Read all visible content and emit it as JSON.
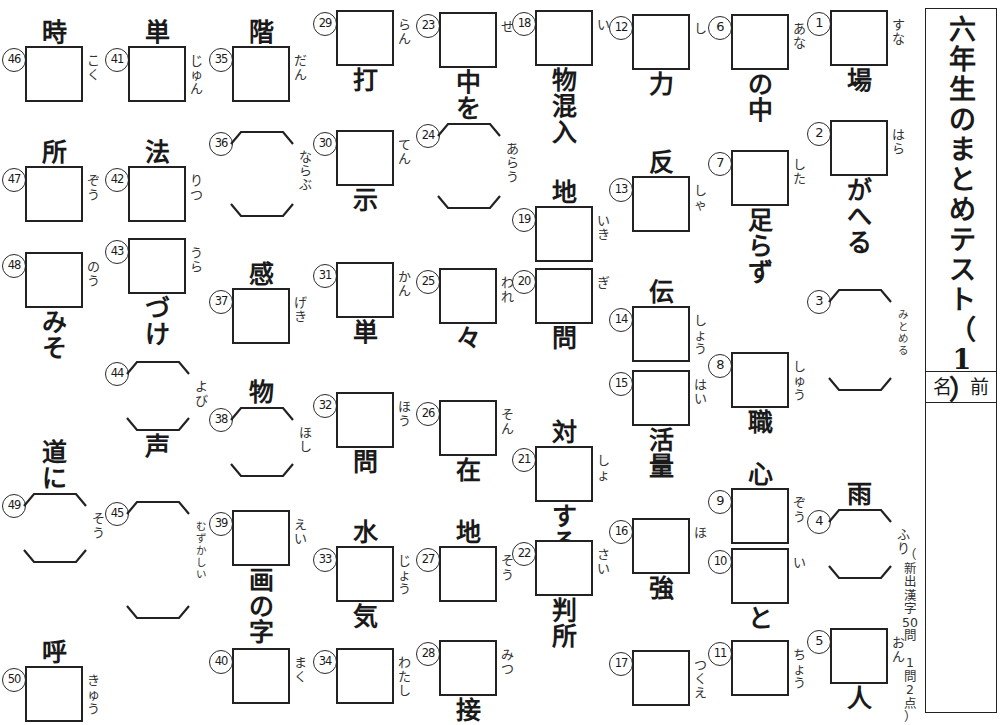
{
  "title_panel": {
    "title_chars": [
      "六",
      "年",
      "生",
      "の",
      "ま",
      "と",
      "め",
      "テ",
      "ス",
      "ト",
      "（",
      "1",
      "）"
    ],
    "name_label": "名 前",
    "score_note_chars": [
      "（",
      "新",
      "出",
      "漢",
      "字",
      "50",
      "問",
      "　",
      "1",
      "問",
      "2",
      "点",
      "）"
    ]
  },
  "columns": [
    {
      "col_index": 0,
      "items": [
        {
          "num": "46",
          "pre": "時",
          "answer": "box",
          "reading": [
            "こ",
            "く"
          ],
          "post": ""
        },
        {
          "num": "47",
          "pre": "所",
          "answer": "box",
          "reading": [
            "ぞ",
            "う"
          ],
          "post": ""
        },
        {
          "num": "48",
          "pre": "",
          "answer": "box",
          "reading": [
            "の",
            "う"
          ],
          "post": "みそ"
        },
        {
          "num": "49",
          "pre": "道に",
          "answer": "bracket",
          "reading": [
            "そ",
            "う"
          ],
          "post": ""
        },
        {
          "num": "50",
          "pre": "呼",
          "answer": "box",
          "reading": [
            "き",
            "ゅ",
            "う"
          ],
          "post": ""
        }
      ]
    },
    {
      "col_index": 1,
      "items": [
        {
          "num": "41",
          "pre": "単",
          "answer": "box",
          "reading": [
            "じ",
            "ゅ",
            "ん"
          ],
          "post": ""
        },
        {
          "num": "42",
          "pre": "法",
          "answer": "box",
          "reading": [
            "り",
            "つ"
          ],
          "post": ""
        },
        {
          "num": "43",
          "pre": "",
          "answer": "box",
          "reading": [
            "う",
            "ら"
          ],
          "post": "づけ"
        },
        {
          "num": "44",
          "pre": "",
          "answer": "bracket",
          "reading": [
            "よ",
            "び"
          ],
          "post": "声"
        },
        {
          "num": "45",
          "pre": "",
          "answer": "bracket",
          "reading": [
            "む",
            "ず",
            "か",
            "し",
            "い"
          ],
          "post": ""
        }
      ]
    },
    {
      "col_index": 2,
      "items": [
        {
          "num": "35",
          "pre": "階",
          "answer": "box",
          "reading": [
            "だ",
            "ん"
          ],
          "post": ""
        },
        {
          "num": "36",
          "pre": "",
          "answer": "bracket",
          "reading": [
            "な",
            "ら",
            "ぶ"
          ],
          "post": ""
        },
        {
          "num": "37",
          "pre": "感",
          "answer": "box",
          "reading": [
            "げ",
            "き"
          ],
          "post": ""
        },
        {
          "num": "38",
          "pre": "物",
          "answer": "bracket",
          "reading": [
            "ほ",
            "し"
          ],
          "post": ""
        },
        {
          "num": "39",
          "pre": "",
          "answer": "box",
          "reading": [
            "え",
            "い"
          ],
          "post": "画の字"
        },
        {
          "num": "40",
          "pre": "",
          "answer": "box",
          "reading": [
            "ま",
            "く"
          ],
          "post": ""
        }
      ]
    },
    {
      "col_index": 3,
      "items": [
        {
          "num": "29",
          "pre": "",
          "answer": "box",
          "reading": [
            "ら",
            "ん"
          ],
          "post": "打"
        },
        {
          "num": "30",
          "pre": "",
          "answer": "box",
          "reading": [
            "て",
            "ん"
          ],
          "post": "示"
        },
        {
          "num": "31",
          "pre": "",
          "answer": "box",
          "reading": [
            "か",
            "ん"
          ],
          "post": "単"
        },
        {
          "num": "32",
          "pre": "",
          "answer": "box",
          "reading": [
            "ほ",
            "う"
          ],
          "post": "問"
        },
        {
          "num": "33",
          "pre": "水",
          "answer": "box",
          "reading": [
            "じ",
            "ょ",
            "う"
          ],
          "post": "気"
        },
        {
          "num": "34",
          "pre": "",
          "answer": "box",
          "reading": [
            "わ",
            "た",
            "し"
          ],
          "post": ""
        }
      ]
    },
    {
      "col_index": 4,
      "items": [
        {
          "num": "23",
          "pre": "",
          "answer": "box",
          "reading": [
            "せ"
          ],
          "post": "中を"
        },
        {
          "num": "24",
          "pre": "",
          "answer": "bracket",
          "reading": [
            "あ",
            "ら",
            "う"
          ],
          "post": ""
        },
        {
          "num": "25",
          "pre": "",
          "answer": "box",
          "reading": [
            "わ",
            "れ"
          ],
          "post": "々"
        },
        {
          "num": "26",
          "pre": "",
          "answer": "box",
          "reading": [
            "そ",
            "ん"
          ],
          "post": "在"
        },
        {
          "num": "27",
          "pre": "地",
          "answer": "box",
          "reading": [
            "そ",
            "う"
          ],
          "post": ""
        },
        {
          "num": "28",
          "pre": "",
          "answer": "box",
          "reading": [
            "み",
            "つ"
          ],
          "post": "接"
        }
      ]
    },
    {
      "col_index": 5,
      "items": [
        {
          "num": "18",
          "pre": "",
          "answer": "box",
          "reading": [
            "い"
          ],
          "post": "物混入"
        },
        {
          "num": "19",
          "pre": "地",
          "answer": "box",
          "reading": [
            "い",
            "き"
          ],
          "post": ""
        },
        {
          "num": "20",
          "pre": "",
          "answer": "box",
          "reading": [
            "ぎ"
          ],
          "post": "問"
        },
        {
          "num": "21",
          "pre": "対",
          "answer": "box",
          "reading": [
            "し",
            "ょ"
          ],
          "post": "する"
        },
        {
          "num": "22",
          "pre": "",
          "answer": "box",
          "reading": [
            "さ",
            "い"
          ],
          "post": "判所"
        }
      ]
    },
    {
      "col_index": 6,
      "items": [
        {
          "num": "12",
          "pre": "",
          "answer": "box",
          "reading": [
            "し"
          ],
          "post": "力"
        },
        {
          "num": "13",
          "pre": "反",
          "answer": "box",
          "reading": [
            "し",
            "ゃ"
          ],
          "post": ""
        },
        {
          "num": "14",
          "pre": "伝",
          "answer": "box",
          "reading": [
            "し",
            "ょ",
            "う"
          ],
          "post": ""
        },
        {
          "num": "15",
          "pre": "",
          "answer": "box",
          "reading": [
            "は",
            "い"
          ],
          "post": "活量"
        },
        {
          "num": "16",
          "pre": "",
          "answer": "box",
          "reading": [
            "ほ"
          ],
          "post": "強"
        },
        {
          "num": "17",
          "pre": "",
          "answer": "box",
          "reading": [
            "つ",
            "く",
            "え"
          ],
          "post": ""
        }
      ]
    },
    {
      "col_index": 7,
      "items": [
        {
          "num": "6",
          "pre": "",
          "answer": "box",
          "reading": [
            "あ",
            "な"
          ],
          "post": "の中"
        },
        {
          "num": "7",
          "pre": "",
          "answer": "box",
          "reading": [
            "し",
            "た"
          ],
          "post": "足らず"
        },
        {
          "num": "8",
          "pre": "",
          "answer": "box",
          "reading": [
            "し",
            "ゅ",
            "う"
          ],
          "post": "職"
        },
        {
          "num": "9",
          "pre": "心",
          "answer": "box",
          "reading": [
            "ぞ",
            "う"
          ],
          "post": ""
        },
        {
          "num": "10",
          "pre": "",
          "answer": "box",
          "reading": [
            "い"
          ],
          "post": "と"
        },
        {
          "num": "11",
          "pre": "",
          "answer": "box",
          "reading": [
            "ち",
            "ょ",
            "う"
          ],
          "post": ""
        }
      ]
    },
    {
      "col_index": 8,
      "items": [
        {
          "num": "1",
          "pre": "",
          "answer": "box",
          "reading": [
            "す",
            "な"
          ],
          "post": "場"
        },
        {
          "num": "2",
          "pre": "",
          "answer": "box",
          "reading": [
            "は",
            "ら"
          ],
          "post": "がへる"
        },
        {
          "num": "3",
          "pre": "",
          "answer": "bracket",
          "reading": [
            "み",
            "と",
            "め",
            "る"
          ],
          "post": ""
        },
        {
          "num": "4",
          "pre": "雨",
          "answer": "bracket",
          "reading": [
            "ふ",
            "り"
          ],
          "post": ""
        },
        {
          "num": "5",
          "pre": "",
          "answer": "box",
          "reading": [
            "お",
            "ん"
          ],
          "post": "人"
        }
      ]
    }
  ],
  "layout": {
    "column_left": [
      0,
      103,
      207,
      311,
      414,
      510,
      607,
      706,
      805
    ],
    "item_tops": [
      [
        20,
        140,
        252,
        440,
        640
      ],
      [
        20,
        140,
        238,
        360,
        500
      ],
      [
        20,
        130,
        262,
        380,
        510,
        648
      ],
      [
        10,
        130,
        262,
        392,
        520,
        648
      ],
      [
        12,
        122,
        268,
        400,
        520,
        640
      ],
      [
        10,
        180,
        268,
        420,
        540
      ],
      [
        14,
        150,
        280,
        370,
        518,
        650
      ],
      [
        14,
        150,
        352,
        462,
        548,
        640
      ],
      [
        10,
        120,
        288,
        482,
        628
      ]
    ]
  }
}
